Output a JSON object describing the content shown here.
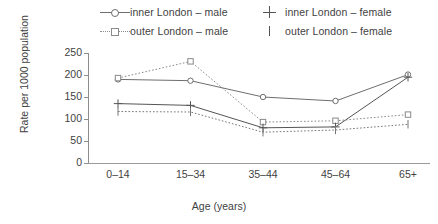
{
  "legend": {
    "items": [
      {
        "label": "inner London – male",
        "marker": "open-circle",
        "line": "solid",
        "col": 1,
        "row": 1
      },
      {
        "label": "inner London – female",
        "marker": "plus",
        "line": "solid",
        "col": 2,
        "row": 1
      },
      {
        "label": "outer London – male",
        "marker": "open-square",
        "line": "dotted",
        "col": 1,
        "row": 2
      },
      {
        "label": "outer London – female",
        "marker": "vbar",
        "line": "dotted",
        "col": 2,
        "row": 2
      }
    ]
  },
  "axes": {
    "ylabel": "Rate per 1000 population",
    "xlabel": "Age (years)",
    "yticks": [
      "0",
      "50",
      "100",
      "150",
      "200",
      "250"
    ],
    "xticks": [
      "0–14",
      "15–34",
      "35–44",
      "45–64",
      "65+"
    ]
  },
  "chart_data": {
    "type": "line",
    "title": "",
    "xlabel": "Age (years)",
    "ylabel": "Rate per 1000 population",
    "categories": [
      "0–14",
      "15–34",
      "35–44",
      "45–64",
      "65+"
    ],
    "ylim": [
      0,
      250
    ],
    "ytick_step": 50,
    "grid": false,
    "legend_position": "top",
    "series": [
      {
        "name": "inner London – male",
        "values": [
          190,
          187,
          150,
          141,
          201
        ],
        "marker": "open-circle",
        "line": "solid",
        "color": "#6e6e6e"
      },
      {
        "name": "outer London – male",
        "values": [
          193,
          231,
          93,
          96,
          110
        ],
        "marker": "open-square",
        "line": "dotted",
        "color": "#8a8a8a"
      },
      {
        "name": "inner London – female",
        "values": [
          135,
          131,
          80,
          82,
          195
        ],
        "marker": "plus",
        "line": "solid",
        "color": "#555555"
      },
      {
        "name": "outer London – female",
        "values": [
          117,
          116,
          70,
          75,
          88
        ],
        "marker": "vbar",
        "line": "dotted",
        "color": "#777777"
      }
    ]
  }
}
